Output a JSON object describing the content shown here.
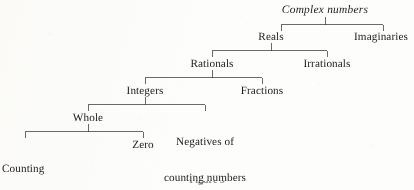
{
  "figure": {
    "kind": "hierarchy-tree",
    "title_italic": true,
    "caption": "Figure 3",
    "ink_color": "#3a3833",
    "text_color": "#1b1a18",
    "background_color": "#fdfdfc"
  },
  "nodes": {
    "complex_numbers": "Complex numbers",
    "reals": "Reals",
    "imaginaries": "Imaginaries",
    "rationals": "Rationals",
    "irrationals": "Irrationals",
    "integers": "Integers",
    "fractions": "Fractions",
    "whole": "Whole",
    "negatives_line1": "Negatives of",
    "negatives_line2": "counting numbers",
    "counting_line1": "Counting",
    "counting_line2": "numbers",
    "zero": "Zero"
  },
  "tree": {
    "levels": [
      {
        "index": 0,
        "labels": [
          "Complex numbers"
        ]
      },
      {
        "index": 1,
        "labels": [
          "Reals",
          "Imaginaries"
        ]
      },
      {
        "index": 2,
        "labels": [
          "Rationals",
          "Irrationals"
        ]
      },
      {
        "index": 3,
        "labels": [
          "Integers",
          "Fractions"
        ]
      },
      {
        "index": 4,
        "labels": [
          "Whole",
          "Negatives of counting numbers"
        ]
      },
      {
        "index": 5,
        "labels": [
          "Counting numbers",
          "Zero"
        ]
      }
    ],
    "edges": [
      {
        "parent": "Complex numbers",
        "children": [
          "Reals",
          "Imaginaries"
        ]
      },
      {
        "parent": "Reals",
        "children": [
          "Rationals",
          "Irrationals"
        ]
      },
      {
        "parent": "Rationals",
        "children": [
          "Integers",
          "Fractions"
        ]
      },
      {
        "parent": "Integers",
        "children": [
          "Whole",
          "Negatives of counting numbers"
        ]
      },
      {
        "parent": "Whole",
        "children": [
          "Counting numbers",
          "Zero"
        ]
      }
    ]
  }
}
